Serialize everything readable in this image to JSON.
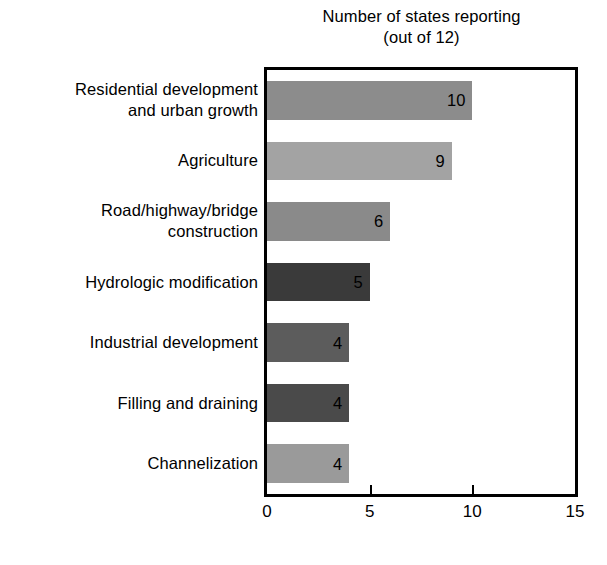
{
  "chart_data": {
    "type": "bar",
    "orientation": "horizontal",
    "title": "Number of states reporting (out of 12)",
    "title_lines": [
      "Number of states reporting",
      "(out of 12)"
    ],
    "xlabel": "",
    "ylabel": "",
    "xlim": [
      0,
      15
    ],
    "xticks": [
      0,
      5,
      10,
      15
    ],
    "xtick_labels": [
      "0",
      "5",
      "10",
      "15"
    ],
    "grid": false,
    "legend": false,
    "categories": [
      "Residential development\nand urban growth",
      "Agriculture",
      "Road/highway/bridge\nconstruction",
      "Hydrologic modification",
      "Industrial development",
      "Filling and draining",
      "Channelization"
    ],
    "values": [
      10,
      9,
      6,
      5,
      4,
      4,
      4
    ],
    "value_labels": [
      "10",
      "9",
      "6",
      "5",
      "4",
      "4",
      "4"
    ],
    "bar_colors": [
      "#8c8c8c",
      "#a3a3a3",
      "#8a8a8a",
      "#3a3a3a",
      "#5c5c5c",
      "#4a4a4a",
      "#9a9a9a"
    ],
    "axis_color": "#000000",
    "background_color": "#ffffff",
    "text_color": "#000000"
  }
}
